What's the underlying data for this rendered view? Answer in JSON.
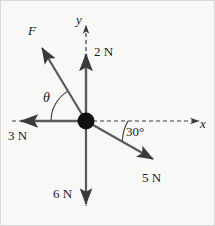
{
  "figure": {
    "type": "force-vector-diagram",
    "background_color": "#f8f8f7",
    "stroke_color": "#3a3a3a",
    "border_color": "#d8d8d6",
    "origin": {
      "x": 85,
      "y": 120,
      "radius": 8,
      "color": "#111111"
    }
  },
  "axes": {
    "x_label": "x",
    "y_label": "y",
    "style": "dashed",
    "x_axis": {
      "from": [
        85,
        120
      ],
      "to": [
        202,
        120
      ]
    },
    "y_axis": {
      "from": [
        85,
        120
      ],
      "to": [
        85,
        18
      ]
    }
  },
  "vectors": [
    {
      "name": "F",
      "label": "F",
      "magnitude": null,
      "unit": "",
      "angle_deg": 121,
      "tip": [
        38,
        43
      ],
      "label_pos": [
        30,
        28
      ],
      "style": "italic"
    },
    {
      "name": "up",
      "label": "2 N",
      "magnitude": 2,
      "unit": "N",
      "angle_deg": 90,
      "tip": [
        85,
        48
      ],
      "label_pos": [
        93,
        48
      ],
      "style": "normal"
    },
    {
      "name": "left",
      "label": "3 N",
      "magnitude": 3,
      "unit": "N",
      "angle_deg": 180,
      "tip": [
        14,
        120
      ],
      "label_pos": [
        8,
        131
      ],
      "style": "normal"
    },
    {
      "name": "down",
      "label": "6 N",
      "magnitude": 6,
      "unit": "N",
      "angle_deg": 270,
      "tip": [
        85,
        209
      ],
      "label_pos": [
        54,
        190
      ],
      "style": "normal"
    },
    {
      "name": "right-down",
      "label": "5 N",
      "magnitude": 5,
      "unit": "N",
      "angle_deg": -30,
      "tip": [
        157,
        162
      ],
      "label_pos": [
        143,
        174
      ],
      "style": "normal"
    }
  ],
  "angles": [
    {
      "name": "theta",
      "label": "θ",
      "between": [
        "3 N",
        "F"
      ],
      "arc_radius": 35,
      "label_pos": [
        46,
        96
      ],
      "style": "italic"
    },
    {
      "name": "thirty",
      "label": "30°",
      "between": [
        "x-axis",
        "5 N"
      ],
      "arc_radius": 42,
      "label_pos": [
        127,
        130
      ],
      "style": "normal"
    }
  ]
}
